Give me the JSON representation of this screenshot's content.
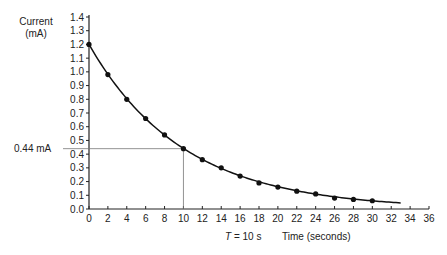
{
  "chart_data": {
    "type": "line",
    "title": "",
    "ylabel": "Current (mA)",
    "ylabel_line1": "Current",
    "ylabel_line2": "(mA)",
    "xlabel": "Time (seconds)",
    "xlim": [
      0,
      36
    ],
    "ylim": [
      0,
      1.4
    ],
    "x_ticks": [
      0,
      2,
      4,
      6,
      8,
      10,
      12,
      14,
      16,
      18,
      20,
      22,
      24,
      26,
      28,
      30,
      32,
      34,
      36
    ],
    "y_ticks": [
      "0.0",
      "0.1",
      "0.2",
      "0.3",
      "0.4",
      "0.5",
      "0.6",
      "0.7",
      "0.8",
      "0.9",
      "1.0",
      "1.1",
      "1.2",
      "1.3",
      "1.4"
    ],
    "grid": false,
    "legend": null,
    "series": [
      {
        "name": "Measured current",
        "style": "points",
        "x": [
          0,
          2,
          4,
          6,
          8,
          10,
          12,
          14,
          16,
          18,
          20,
          22,
          24,
          26,
          28,
          30
        ],
        "y": [
          1.2,
          0.98,
          0.8,
          0.66,
          0.54,
          0.44,
          0.36,
          0.3,
          0.24,
          0.19,
          0.16,
          0.13,
          0.11,
          0.08,
          0.07,
          0.06
        ]
      },
      {
        "name": "Fitted exponential decay",
        "style": "curve",
        "x_range": [
          0,
          33
        ],
        "y0": 1.2,
        "time_constant": 10
      }
    ],
    "annotations": [
      {
        "type": "hline",
        "y": 0.44,
        "x_end": 10,
        "label": "0.44 mA"
      },
      {
        "type": "vline",
        "x": 10,
        "y_end": 0.44,
        "label": "T = 10 s"
      }
    ]
  },
  "labels": {
    "hline_label": "0.44 mA",
    "vline_label_T": "T",
    "vline_label_rest": " = 10 s",
    "xlabel": "Time (seconds)",
    "ylabel_line1": "Current",
    "ylabel_line2": "(mA)"
  }
}
